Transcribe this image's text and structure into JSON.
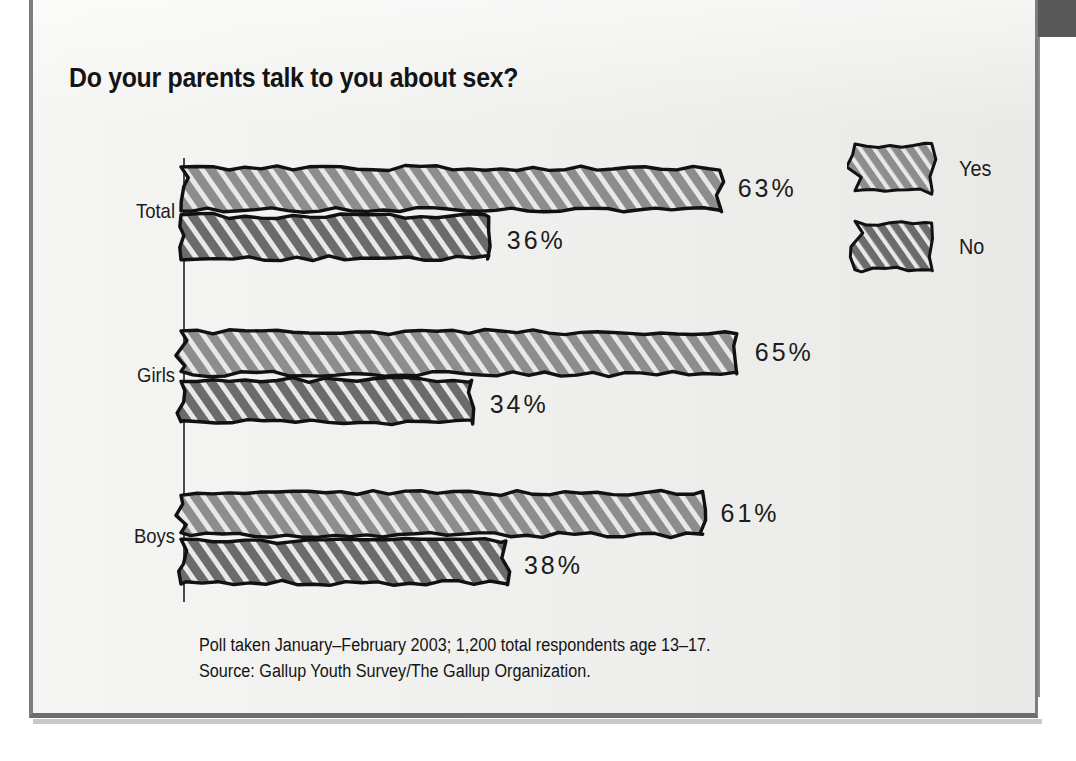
{
  "figure": {
    "title": "Do your parents talk to you about sex?",
    "footnote_line1": "Poll taken January–February 2003; 1,200 total respondents age 13–17.",
    "footnote_line2": "Source: Gallup Youth Survey/The Gallup Organization."
  },
  "legend": {
    "items": [
      {
        "label": "Yes",
        "color": "#8d8d8d",
        "swatch_name": "legend-swatch-yes"
      },
      {
        "label": "No",
        "color": "#6b6b6b",
        "swatch_name": "legend-swatch-no"
      }
    ]
  },
  "colors": {
    "background": "#eeeeec",
    "page": "#ffffff",
    "band": "#585858",
    "frame": "#7d7d7d",
    "ink": "#141414",
    "yes_fill": "#8d8d8d",
    "no_fill": "#6b6b6b",
    "hatch": "#e8e8e6",
    "axis": "#4a4a4a"
  },
  "chart_data": {
    "type": "bar",
    "orientation": "horizontal",
    "title": "Do your parents talk to you about sex?",
    "xlabel": "",
    "ylabel": "",
    "xlim": [
      0,
      70
    ],
    "grid": false,
    "legend_position": "right",
    "categories": [
      "Total",
      "Girls",
      "Boys"
    ],
    "series": [
      {
        "name": "Yes",
        "values": [
          63,
          65,
          61
        ],
        "labels": [
          "63%",
          "65%",
          "61%"
        ],
        "color": "#8d8d8d"
      },
      {
        "name": "No",
        "values": [
          36,
          34,
          38
        ],
        "labels": [
          "36%",
          "34%",
          "38%"
        ],
        "color": "#6b6b6b"
      }
    ],
    "annotations": [
      "Poll taken January–February 2003; 1,200 total respondents age 13–17.",
      "Source: Gallup Youth Survey/The Gallup Organization."
    ]
  }
}
